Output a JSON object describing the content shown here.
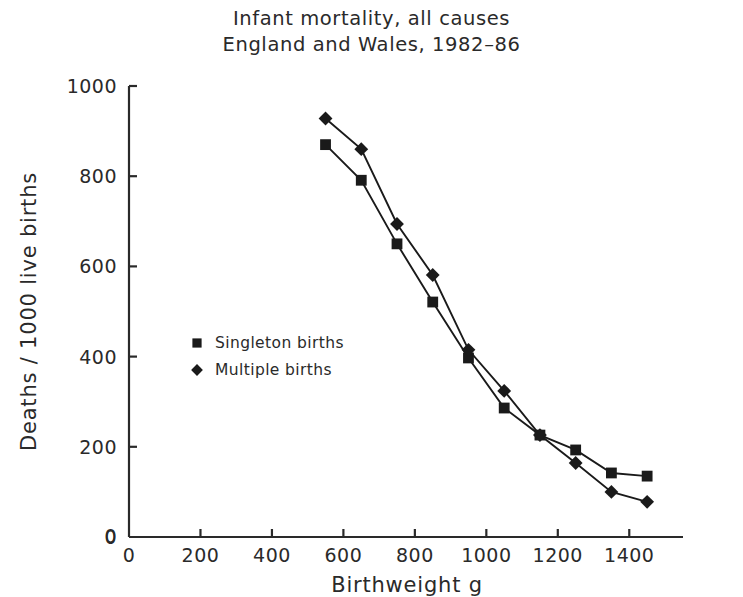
{
  "chart_data": {
    "type": "line",
    "title": "Infant mortality, all causes",
    "subtitle": "England and Wales, 1982–86",
    "xlabel": "Birthweight g",
    "ylabel": "Deaths / 1000 live births",
    "xlim": [
      0,
      1500
    ],
    "ylim": [
      0,
      1000
    ],
    "xticks": [
      0,
      200,
      400,
      600,
      800,
      1000,
      1200,
      1400
    ],
    "xtick_labels": [
      "0",
      "200",
      "400",
      "600",
      "800",
      "1000",
      "1200",
      "1400"
    ],
    "yticks": [
      0,
      200,
      400,
      600,
      800,
      1000
    ],
    "ytick_labels": [
      "0",
      "200",
      "400",
      "600",
      "800",
      "1000"
    ],
    "grid": false,
    "legend_position": "center-left",
    "x": [
      550,
      650,
      750,
      850,
      950,
      1050,
      1150,
      1250,
      1350,
      1450
    ],
    "series": [
      {
        "name": "Singleton births",
        "marker": "square",
        "color": "#000000",
        "values": [
          870,
          791,
          650,
          521,
          397,
          286,
          226,
          193,
          142,
          135
        ]
      },
      {
        "name": "Multiple births",
        "marker": "diamond",
        "color": "#000000",
        "values": [
          928,
          860,
          694,
          581,
          415,
          324,
          226,
          164,
          100,
          78
        ]
      }
    ],
    "legend": [
      {
        "label": "Singleton births",
        "marker": "square"
      },
      {
        "label": "Multiple births",
        "marker": "diamond"
      }
    ],
    "axis_color": "#2a2a2a",
    "line_color": "#1a1a1a"
  }
}
